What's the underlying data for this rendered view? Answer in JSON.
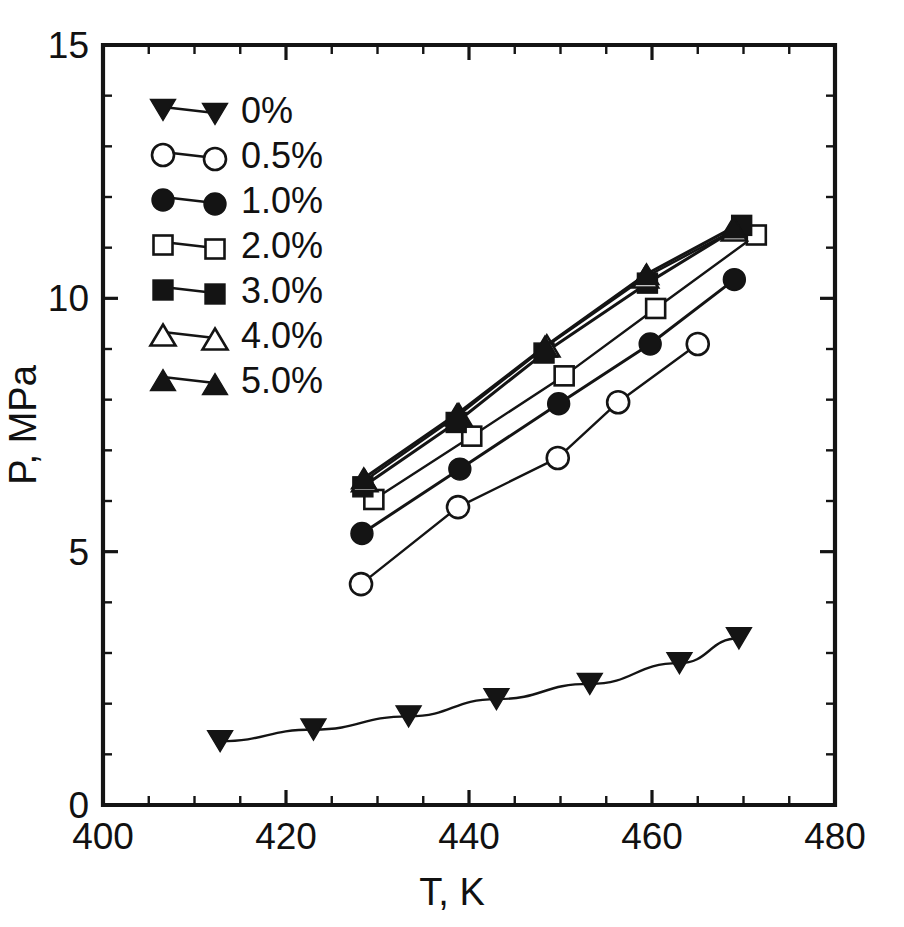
{
  "chart_data": {
    "type": "line",
    "title": "",
    "xlabel": "T, K",
    "ylabel": "P, MPa",
    "xlim": [
      400,
      480
    ],
    "ylim": [
      0,
      15
    ],
    "xticks": [
      400,
      420,
      440,
      460,
      480
    ],
    "xtick_labels": [
      "400",
      "420",
      "440",
      "460",
      "480"
    ],
    "xminor_step": 5,
    "yticks": [
      0,
      5,
      10,
      15
    ],
    "ytick_labels": [
      "0",
      "5",
      "10",
      "15"
    ],
    "yminor_step": 1,
    "grid": false,
    "legend_position": "upper-left",
    "frame": "box",
    "series": [
      {
        "name": "0%",
        "label": "0%",
        "marker": "filled-triangle-down",
        "filled": true,
        "x": [
          412.8,
          423.0,
          433.4,
          443.0,
          453.2,
          463.0,
          469.5
        ],
        "y": [
          1.26,
          1.49,
          1.75,
          2.09,
          2.39,
          2.8,
          3.29
        ]
      },
      {
        "name": "0.5%",
        "label": "0.5%",
        "marker": "open-circle",
        "filled": false,
        "x": [
          428.2,
          438.8,
          449.7,
          456.3,
          465.0
        ],
        "y": [
          4.36,
          5.88,
          6.85,
          7.95,
          9.1
        ]
      },
      {
        "name": "1.0%",
        "label": "1.0%",
        "marker": "filled-circle",
        "filled": true,
        "x": [
          428.3,
          439.0,
          449.8,
          459.8,
          469.0
        ],
        "y": [
          5.36,
          6.63,
          7.92,
          9.1,
          10.37
        ]
      },
      {
        "name": "2.0%",
        "label": "2.0%",
        "marker": "open-square",
        "filled": false,
        "x": [
          429.6,
          440.3,
          450.4,
          460.4,
          471.4
        ],
        "y": [
          6.03,
          7.28,
          8.47,
          9.8,
          11.25
        ]
      },
      {
        "name": "3.0%",
        "label": "3.0%",
        "marker": "filled-square",
        "filled": true,
        "x": [
          428.4,
          438.6,
          448.2,
          459.5,
          469.8
        ],
        "y": [
          6.28,
          7.55,
          8.92,
          10.3,
          11.44
        ]
      },
      {
        "name": "4.0%",
        "label": "4.0%",
        "marker": "open-triangle-up",
        "filled": false,
        "x": [
          428.6,
          438.9,
          448.5,
          459.3,
          469.0
        ],
        "y": [
          6.4,
          7.7,
          9.06,
          10.42,
          11.35
        ]
      },
      {
        "name": "5.0%",
        "label": "5.0%",
        "marker": "filled-triangle-up",
        "filled": true,
        "x": [
          428.5,
          438.7,
          448.3,
          459.4,
          468.9
        ],
        "y": [
          6.45,
          7.72,
          9.05,
          10.48,
          11.4
        ]
      }
    ]
  },
  "legend": {
    "entries": [
      {
        "label": "0%",
        "marker": "filled-triangle-down"
      },
      {
        "label": "0.5%",
        "marker": "open-circle"
      },
      {
        "label": "1.0%",
        "marker": "filled-circle"
      },
      {
        "label": "2.0%",
        "marker": "open-square"
      },
      {
        "label": "3.0%",
        "marker": "filled-square"
      },
      {
        "label": "4.0%",
        "marker": "open-triangle-up"
      },
      {
        "label": "5.0%",
        "marker": "filled-triangle-up"
      }
    ]
  },
  "colors": {
    "ink": "#141414",
    "background": "#ffffff",
    "marker_fill_open": "#ffffff"
  },
  "caption": {
    "text": ""
  }
}
